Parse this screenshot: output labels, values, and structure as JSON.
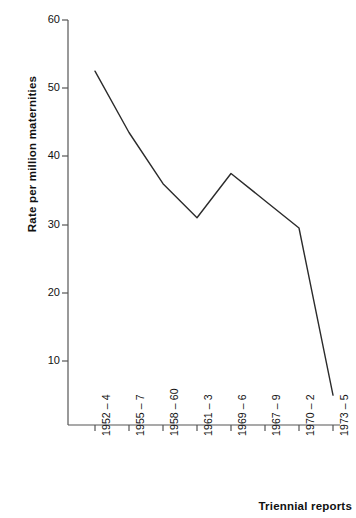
{
  "chart_data": {
    "type": "line",
    "title": "",
    "xlabel": "Triennial reports",
    "ylabel": "Rate per million maternities",
    "categories": [
      "1952 – 4",
      "1955 – 7",
      "1958 – 60",
      "1961 – 3",
      "1969 – 6",
      "1967 – 9",
      "1970 – 2",
      "1973 – 5"
    ],
    "values": [
      52.5,
      43.5,
      36.0,
      31.0,
      37.5,
      33.5,
      29.5,
      5.0
    ],
    "ylim": [
      0,
      60
    ],
    "yticks": [
      10,
      20,
      30,
      40,
      50,
      60
    ],
    "ytick_labels": [
      "10",
      "20",
      "30",
      "40",
      "50",
      "60"
    ],
    "grid": false,
    "legend": null,
    "line_color": "#2b2b2b",
    "axis_color": "#555555"
  },
  "axis": {
    "y_title": "Rate per million maternities",
    "x_title": "Triennial reports"
  }
}
